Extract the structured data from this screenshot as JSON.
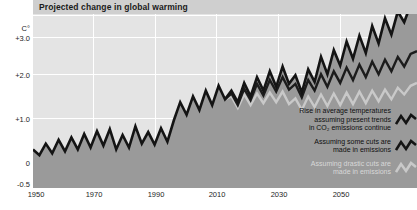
{
  "title": "Projected change in global warming",
  "axes": {
    "y_unit_label": "C°",
    "y_ticks": [
      "+3.0",
      "+2.0",
      "+1.0",
      "0",
      "-0.5"
    ],
    "x_ticks": [
      "1950",
      "1970",
      "1990",
      "2010",
      "2030",
      "2050"
    ]
  },
  "legend": {
    "items": [
      {
        "label": "Rise in average temperatures\nassuming present trends\nin CO₂ emissions continue",
        "icon": "zigzag-line-icon",
        "color": "#141414"
      },
      {
        "label": "Assuming some cuts are\nmade in emissions",
        "icon": "zigzag-line-icon",
        "color": "#141414"
      },
      {
        "label": "Assuming drastic cuts are\nmade in emissions",
        "icon": "zigzag-line-icon",
        "color": "#c9c9c9"
      }
    ]
  },
  "colors": {
    "plot_background": "#e4e4e4",
    "gridline": "#ffffff",
    "fill_area": "#9a9a9a",
    "fill_below_zero": "#8d8d8d",
    "line_primary": "#141414",
    "line_secondary": "#1c1c1c",
    "line_tertiary": "#c9c9c9",
    "title_background": "#cfcfcf"
  },
  "chart_data": {
    "type": "line",
    "title": "Projected change in global warming",
    "xlabel": "",
    "ylabel": "C°",
    "xlim": [
      1950,
      2070
    ],
    "ylim": [
      -0.5,
      3.4
    ],
    "grid": true,
    "legend_position": "inside-bottom-right",
    "x": [
      1950,
      1952,
      1954,
      1956,
      1958,
      1960,
      1962,
      1964,
      1966,
      1968,
      1970,
      1972,
      1974,
      1976,
      1978,
      1980,
      1982,
      1984,
      1986,
      1988,
      1990,
      1992,
      1994,
      1996,
      1998,
      2000,
      2002,
      2004,
      2006,
      2008,
      2010,
      2012,
      2014,
      2016,
      2018,
      2020,
      2022,
      2024,
      2026,
      2028,
      2030,
      2032,
      2034,
      2036,
      2038,
      2040,
      2042,
      2044,
      2046,
      2048,
      2050,
      2052,
      2054,
      2056,
      2058,
      2060,
      2062,
      2064,
      2066,
      2068,
      2070
    ],
    "series": [
      {
        "name": "Rise in average temperatures assuming present trends in CO2 emissions continue",
        "color": "#141414",
        "values": [
          0.3,
          0.18,
          0.42,
          0.22,
          0.5,
          0.26,
          0.55,
          0.3,
          0.62,
          0.34,
          0.68,
          0.38,
          0.72,
          0.3,
          0.6,
          0.34,
          0.78,
          0.42,
          0.66,
          0.4,
          0.74,
          0.46,
          0.9,
          1.28,
          1.02,
          1.4,
          1.12,
          1.52,
          1.22,
          1.62,
          1.34,
          1.52,
          1.28,
          1.68,
          1.4,
          1.8,
          1.52,
          1.92,
          1.6,
          2.02,
          1.66,
          1.84,
          1.48,
          1.96,
          1.7,
          2.22,
          1.86,
          2.36,
          2.04,
          2.54,
          2.18,
          2.66,
          2.3,
          2.86,
          2.5,
          3.02,
          2.68,
          3.16,
          2.94,
          3.3,
          3.44
        ]
      },
      {
        "name": "Assuming some cuts are made in emissions",
        "color": "#1c1c1c",
        "values": [
          null,
          null,
          null,
          null,
          null,
          null,
          null,
          null,
          null,
          null,
          null,
          null,
          null,
          null,
          null,
          null,
          null,
          null,
          null,
          null,
          null,
          null,
          null,
          null,
          null,
          null,
          null,
          null,
          null,
          null,
          1.34,
          1.46,
          1.22,
          1.56,
          1.32,
          1.66,
          1.42,
          1.74,
          1.5,
          1.8,
          1.54,
          1.66,
          1.38,
          1.74,
          1.52,
          1.86,
          1.6,
          1.92,
          1.68,
          2.0,
          1.74,
          2.06,
          1.8,
          2.12,
          1.86,
          2.16,
          1.92,
          2.22,
          2.02,
          2.28,
          2.34
        ]
      },
      {
        "name": "Assuming drastic cuts are made in emissions",
        "color": "#c9c9c9",
        "values": [
          null,
          null,
          null,
          null,
          null,
          null,
          null,
          null,
          null,
          null,
          null,
          null,
          null,
          null,
          null,
          null,
          null,
          null,
          null,
          null,
          null,
          null,
          null,
          null,
          null,
          null,
          null,
          null,
          null,
          null,
          1.34,
          1.4,
          1.16,
          1.44,
          1.22,
          1.46,
          1.26,
          1.48,
          1.28,
          1.5,
          1.24,
          1.36,
          1.12,
          1.4,
          1.18,
          1.44,
          1.2,
          1.46,
          1.22,
          1.48,
          1.24,
          1.5,
          1.26,
          1.52,
          1.3,
          1.54,
          1.34,
          1.58,
          1.44,
          1.62,
          1.68
        ]
      }
    ]
  }
}
